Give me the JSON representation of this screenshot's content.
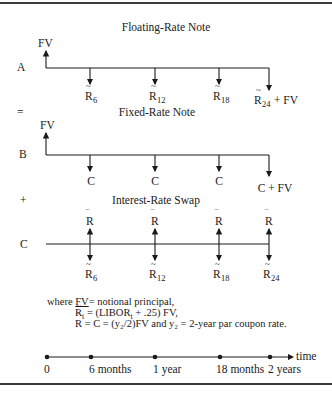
{
  "sections": {
    "a": {
      "title": "Floating-Rate Note",
      "row_label": "A",
      "principal_label": "FV",
      "flows": [
        {
          "base": "R",
          "accent": "~",
          "sub": "6",
          "suffix": ""
        },
        {
          "base": "R",
          "accent": "~",
          "sub": "12",
          "suffix": ""
        },
        {
          "base": "R",
          "accent": "~",
          "sub": "18",
          "suffix": ""
        },
        {
          "base": "R",
          "accent": "~",
          "sub": "24",
          "suffix": " + FV"
        }
      ]
    },
    "op1": "=",
    "b": {
      "title": "Fixed-Rate Note",
      "row_label": "B",
      "principal_label": "FV",
      "flows": [
        {
          "label": "C"
        },
        {
          "label": "C"
        },
        {
          "label": "C"
        },
        {
          "label": "C + FV"
        }
      ]
    },
    "op2": "+",
    "c": {
      "title": "Interest-Rate Swap",
      "row_label": "C",
      "receive": [
        {
          "base": "R",
          "accent": "‾"
        },
        {
          "base": "R",
          "accent": "‾"
        },
        {
          "base": "R",
          "accent": "‾"
        },
        {
          "base": "R",
          "accent": "‾"
        }
      ],
      "pay": [
        {
          "base": "R",
          "accent": "~",
          "sub": "6"
        },
        {
          "base": "R",
          "accent": "~",
          "sub": "12"
        },
        {
          "base": "R",
          "accent": "~",
          "sub": "18"
        },
        {
          "base": "R",
          "accent": "~",
          "sub": "24"
        }
      ]
    }
  },
  "legend": {
    "line1_prefix": "where ",
    "line1_fv": "FV",
    "line1_rest": "= notional principal,",
    "line2_base": "R",
    "line2_accent": "~",
    "line2_sub": "t",
    "line2_rest": " = (LIBOR",
    "line2_sub2": "t",
    "line2_rest2": " + .25) FV,",
    "line3_base": "R",
    "line3_accent": "‾",
    "line3_rest": " = C = (y₂/2)FV and y₂ = 2-year par coupon rate."
  },
  "timeline": {
    "axis_label": "time",
    "ticks": [
      "0",
      "6 months",
      "1 year",
      "18 months",
      "2 years"
    ]
  }
}
